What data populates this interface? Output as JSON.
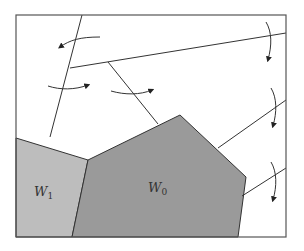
{
  "diagram": {
    "type": "partition-with-regions",
    "colors": {
      "frame": "#555555",
      "line": "#333333",
      "w0_fill": "#9a9a9a",
      "w1_fill": "#bdbdbd",
      "arrow": "#222222"
    },
    "regions": [
      {
        "id": "W0",
        "label_main": "W",
        "label_sub": "0"
      },
      {
        "id": "W1",
        "label_main": "W",
        "label_sub": "1"
      }
    ]
  }
}
